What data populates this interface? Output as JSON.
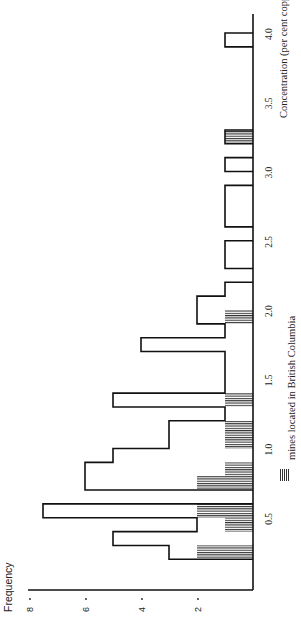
{
  "chart_data": {
    "type": "bar",
    "orientation": "rotated-90-ccw",
    "title": "",
    "xlabel": "Concentration (per cent copper)",
    "ylabel": "Frequency",
    "x_ticks": [
      "0.5",
      "1.0",
      "1.5",
      "2.0",
      "2.5",
      "3.0",
      "3.5",
      "4.0"
    ],
    "y_ticks": [
      "2",
      "4",
      "6",
      "8"
    ],
    "xlim": [
      0.0,
      4.0
    ],
    "ylim": [
      0,
      8
    ],
    "bin_width": 0.1,
    "legend": [
      {
        "label": "mines located in British Columbia",
        "pattern": "hatched"
      }
    ],
    "series": [
      {
        "name": "All mines",
        "bins": [
          {
            "from": 0.2,
            "to": 0.3,
            "value": 3
          },
          {
            "from": 0.3,
            "to": 0.4,
            "value": 5
          },
          {
            "from": 0.4,
            "to": 0.5,
            "value": 2
          },
          {
            "from": 0.5,
            "to": 0.6,
            "value": 7.5
          },
          {
            "from": 0.7,
            "to": 0.8,
            "value": 6
          },
          {
            "from": 0.8,
            "to": 0.9,
            "value": 6
          },
          {
            "from": 0.9,
            "to": 1.0,
            "value": 5
          },
          {
            "from": 1.0,
            "to": 1.1,
            "value": 3
          },
          {
            "from": 1.1,
            "to": 1.2,
            "value": 3
          },
          {
            "from": 1.2,
            "to": 1.3,
            "value": 1
          },
          {
            "from": 1.3,
            "to": 1.4,
            "value": 5
          },
          {
            "from": 1.4,
            "to": 1.5,
            "value": 1
          },
          {
            "from": 1.5,
            "to": 1.6,
            "value": 1
          },
          {
            "from": 1.6,
            "to": 1.7,
            "value": 1
          },
          {
            "from": 1.7,
            "to": 1.8,
            "value": 4
          },
          {
            "from": 1.8,
            "to": 1.9,
            "value": 1
          },
          {
            "from": 1.9,
            "to": 2.0,
            "value": 2
          },
          {
            "from": 2.0,
            "to": 2.1,
            "value": 2
          },
          {
            "from": 2.1,
            "to": 2.2,
            "value": 1
          },
          {
            "from": 2.3,
            "to": 2.4,
            "value": 1
          },
          {
            "from": 2.4,
            "to": 2.5,
            "value": 1
          },
          {
            "from": 2.6,
            "to": 2.7,
            "value": 1
          },
          {
            "from": 2.7,
            "to": 2.8,
            "value": 1
          },
          {
            "from": 2.8,
            "to": 2.9,
            "value": 1
          },
          {
            "from": 3.0,
            "to": 3.1,
            "value": 1
          },
          {
            "from": 3.2,
            "to": 3.3,
            "value": 1
          },
          {
            "from": 3.9,
            "to": 4.0,
            "value": 1
          }
        ]
      },
      {
        "name": "mines located in British Columbia",
        "bins": [
          {
            "from": 0.2,
            "to": 0.3,
            "value": 2
          },
          {
            "from": 0.4,
            "to": 0.5,
            "value": 1
          },
          {
            "from": 0.5,
            "to": 0.6,
            "value": 2
          },
          {
            "from": 0.7,
            "to": 0.8,
            "value": 2
          },
          {
            "from": 0.8,
            "to": 0.9,
            "value": 1
          },
          {
            "from": 1.0,
            "to": 1.1,
            "value": 1
          },
          {
            "from": 1.1,
            "to": 1.2,
            "value": 1
          },
          {
            "from": 1.3,
            "to": 1.4,
            "value": 1
          },
          {
            "from": 1.9,
            "to": 2.0,
            "value": 1
          },
          {
            "from": 3.2,
            "to": 3.3,
            "value": 1
          }
        ]
      }
    ]
  },
  "labels": {
    "ylabel": "Frequency",
    "xlabel": "Concentration (per cent copper)",
    "legend": "mines located in British Columbia"
  }
}
